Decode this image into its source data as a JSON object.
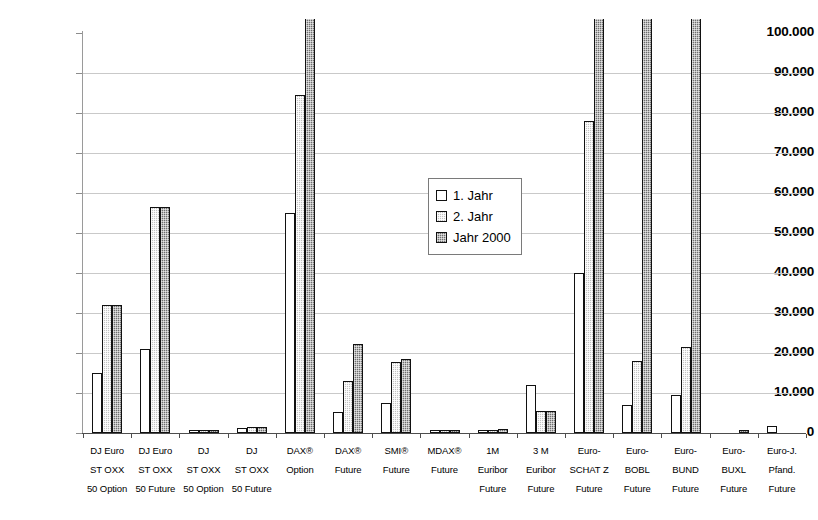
{
  "chart_data": {
    "type": "bar",
    "title": "",
    "xlabel": "",
    "ylabel": "",
    "ylim": [
      0,
      100000
    ],
    "grid": true,
    "legend_position": "center",
    "y_ticks": [
      "0",
      "10.000",
      "20.000",
      "30.000",
      "40.000",
      "50.000",
      "60.000",
      "70.000",
      "80.000",
      "90.000",
      "100.000"
    ],
    "y_tick_values": [
      0,
      10000,
      20000,
      30000,
      40000,
      50000,
      60000,
      70000,
      80000,
      90000,
      100000
    ],
    "categories": [
      "DJ Euro STOXX 50 Option",
      "DJ Euro STOXX 50 Future",
      "DJ STOXX 50 Option",
      "DJ STOXX 50 Future",
      "DAX® Option",
      "DAX® Future",
      "SMI® Future",
      "MDAX® Future",
      "1M Euribor Future",
      "3 M Euribor Future",
      "Euro-SCHATZ Future",
      "Euro-BOBL Future",
      "Euro-BUND Future",
      "Euro-BUXL Future",
      "Euro-J. Pfand. Future"
    ],
    "category_lines": [
      [
        "DJ Euro",
        "ST OXX",
        "50 Option"
      ],
      [
        "DJ Euro",
        "ST OXX",
        "50 Future"
      ],
      [
        "DJ",
        "ST OXX",
        "50 Option"
      ],
      [
        "DJ",
        "ST OXX",
        "50 Future"
      ],
      [
        "DAX®",
        "Option",
        ""
      ],
      [
        "DAX®",
        "Future",
        ""
      ],
      [
        "SMI®",
        "Future",
        ""
      ],
      [
        "MDAX®",
        "Future",
        ""
      ],
      [
        "1M",
        "Euribor",
        "Future"
      ],
      [
        "3 M",
        "Euribor",
        "Future"
      ],
      [
        "Euro-",
        "SCHAT Z",
        "Future"
      ],
      [
        "Euro-",
        "BOBL",
        "Future"
      ],
      [
        "Euro-",
        "BUND",
        "Future"
      ],
      [
        "Euro-",
        "BUXL",
        "Future"
      ],
      [
        "Euro-J.",
        "Pfand.",
        "Future"
      ]
    ],
    "series": [
      {
        "name": "1. Jahr",
        "fill": "white",
        "values": [
          15000,
          21000,
          400,
          1300,
          55000,
          5200,
          7400,
          600,
          600,
          12000,
          40000,
          7000,
          9500,
          0,
          1800
        ]
      },
      {
        "name": "2. Jahr",
        "fill": "light-gray-hatch",
        "values": [
          32000,
          56400,
          400,
          1400,
          84500,
          13000,
          17800,
          700,
          800,
          5400,
          78000,
          18000,
          21500,
          0,
          0
        ]
      },
      {
        "name": "Jahr 2000",
        "fill": "dark-gray-hatch",
        "values": [
          32000,
          56400,
          500,
          1400,
          104000,
          22200,
          18400,
          700,
          900,
          5400,
          104000,
          104000,
          104000,
          800,
          0
        ]
      }
    ]
  },
  "legend": {
    "items": [
      {
        "label": "1. Jahr"
      },
      {
        "label": "2. Jahr"
      },
      {
        "label": "Jahr 2000"
      }
    ]
  },
  "colors": {
    "series1": "#ffffff",
    "series2": "#c3c3c3",
    "series3": "#6e6e6e",
    "grid": "#c9c9c9",
    "axis": "#4d4d4d",
    "text": "#000000"
  }
}
